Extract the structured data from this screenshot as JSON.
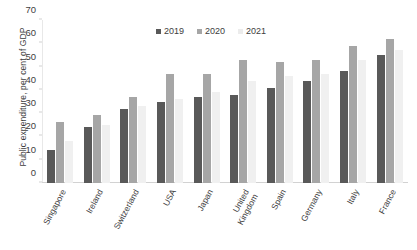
{
  "chart_data": {
    "type": "bar",
    "title": "",
    "xlabel": "",
    "ylabel": "Public expenditure, per cent of GDP",
    "ylim": [
      0,
      70
    ],
    "yticks": [
      0,
      10,
      20,
      30,
      40,
      50,
      60,
      70
    ],
    "grid": false,
    "legend_position": "top-center",
    "categories": [
      "Singapore",
      "Ireland",
      "Switzerland",
      "USA",
      "Japan",
      "United Kingdom",
      "Spain",
      "Germany",
      "Italy",
      "France"
    ],
    "series": [
      {
        "name": "2019",
        "color": "#595959",
        "values": [
          14,
          24,
          32,
          35,
          37,
          38,
          41,
          44,
          48,
          55
        ]
      },
      {
        "name": "2020",
        "color": "#a6a6a6",
        "values": [
          26,
          29,
          37,
          47,
          47,
          53,
          52,
          53,
          59,
          62
        ]
      },
      {
        "name": "2021",
        "color": "#f0f0f0",
        "values": [
          18,
          25,
          33,
          36,
          39,
          44,
          46,
          47,
          53,
          57
        ]
      }
    ]
  },
  "legend": {
    "items": [
      {
        "label": "2019"
      },
      {
        "label": "2020"
      },
      {
        "label": "2021"
      }
    ]
  }
}
